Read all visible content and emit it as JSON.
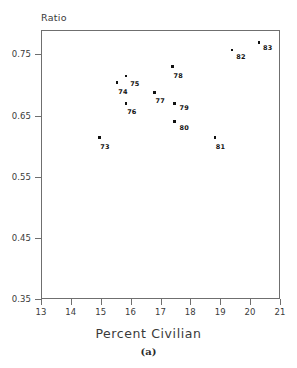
{
  "chart_data": {
    "type": "scatter",
    "title": "",
    "xlabel": "Percent Civilian",
    "ylabel": "Ratio",
    "panel_label": "(a)",
    "xlim": [
      13,
      21
    ],
    "ylim": [
      0.35,
      0.79
    ],
    "xticks": [
      13,
      14,
      15,
      16,
      17,
      18,
      19,
      20,
      21
    ],
    "xtick_labels": [
      "13",
      "14",
      "15",
      "16",
      "17",
      "18",
      "19",
      "20",
      "21"
    ],
    "yticks": [
      0.35,
      0.45,
      0.55,
      0.65,
      0.75
    ],
    "ytick_labels": [
      "0.35",
      "0.45",
      "0.55",
      "0.65",
      "0.75"
    ],
    "grid": false,
    "legend": "none",
    "point_labels_shown": true,
    "points": [
      {
        "label": "73",
        "x": 14.95,
        "y": 0.614,
        "label_dx": 1,
        "label_dy": 5
      },
      {
        "label": "74",
        "x": 15.55,
        "y": 0.704,
        "label_dx": 1,
        "label_dy": 5
      },
      {
        "label": "75",
        "x": 15.85,
        "y": 0.715,
        "label_dx": 4,
        "label_dy": 4
      },
      {
        "label": "76",
        "x": 15.85,
        "y": 0.67,
        "label_dx": 1,
        "label_dy": 5
      },
      {
        "label": "77",
        "x": 16.8,
        "y": 0.688,
        "label_dx": 1,
        "label_dy": 5
      },
      {
        "label": "78",
        "x": 17.4,
        "y": 0.73,
        "label_dx": 1,
        "label_dy": 5
      },
      {
        "label": "79",
        "x": 17.47,
        "y": 0.67,
        "label_dx": 5,
        "label_dy": 1
      },
      {
        "label": "80",
        "x": 17.47,
        "y": 0.64,
        "label_dx": 5,
        "label_dy": 2
      },
      {
        "label": "81",
        "x": 18.82,
        "y": 0.614,
        "label_dx": 1,
        "label_dy": 5
      },
      {
        "label": "82",
        "x": 19.4,
        "y": 0.757,
        "label_dx": 4,
        "label_dy": 3
      },
      {
        "label": "83",
        "x": 20.3,
        "y": 0.77,
        "label_dx": 4,
        "label_dy": 2
      }
    ]
  }
}
